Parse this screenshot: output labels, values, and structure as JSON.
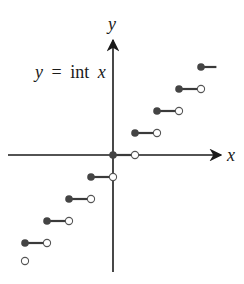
{
  "chart_data": {
    "type": "scatter",
    "subtype": "step-function",
    "title": "y = int x",
    "function_label": {
      "lhs": "y",
      "eq": "=",
      "fn": "int",
      "var": "x"
    },
    "xlabel": "x",
    "ylabel": "y",
    "xlim": [
      -4,
      4
    ],
    "ylim": [
      -4,
      4
    ],
    "grid": false,
    "legend": null,
    "segments": [
      {
        "x_start": -4,
        "x_end": -3,
        "y": -4,
        "closed_left": true,
        "open_right": true
      },
      {
        "x_start": -3,
        "x_end": -2,
        "y": -3,
        "closed_left": true,
        "open_right": true
      },
      {
        "x_start": -2,
        "x_end": -1,
        "y": -2,
        "closed_left": true,
        "open_right": true
      },
      {
        "x_start": -1,
        "x_end": 0,
        "y": -1,
        "closed_left": true,
        "open_right": true
      },
      {
        "x_start": 0,
        "x_end": 1,
        "y": 0,
        "closed_left": true,
        "open_right": true
      },
      {
        "x_start": 1,
        "x_end": 2,
        "y": 1,
        "closed_left": true,
        "open_right": true
      },
      {
        "x_start": 2,
        "x_end": 3,
        "y": 2,
        "closed_left": true,
        "open_right": true
      },
      {
        "x_start": 3,
        "x_end": 4,
        "y": 3,
        "closed_left": true,
        "open_right": true
      },
      {
        "x_start": 4,
        "x_end": 4.7,
        "y": 4,
        "closed_left": true,
        "open_right": false
      }
    ],
    "extra_open_points": [
      {
        "x": -4,
        "y": -5
      }
    ]
  },
  "colors": {
    "axis": "#1a1a1a",
    "segment": "#3a3a3a",
    "dot": "#444444"
  }
}
